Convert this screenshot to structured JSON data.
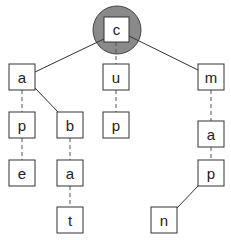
{
  "diagram": {
    "type": "trie",
    "highlight_color": "#8a8a8a",
    "root": {
      "id": "c",
      "label": "c",
      "highlighted": true
    },
    "nodes": [
      {
        "id": "c",
        "label": "c",
        "x": 104,
        "y": 17
      },
      {
        "id": "a1",
        "label": "a",
        "x": 9,
        "y": 64
      },
      {
        "id": "u",
        "label": "u",
        "x": 103,
        "y": 64
      },
      {
        "id": "m",
        "label": "m",
        "x": 198,
        "y": 64
      },
      {
        "id": "p1",
        "label": "p",
        "x": 9,
        "y": 112
      },
      {
        "id": "b",
        "label": "b",
        "x": 57,
        "y": 112
      },
      {
        "id": "p2",
        "label": "p",
        "x": 103,
        "y": 112
      },
      {
        "id": "a3",
        "label": "a",
        "x": 198,
        "y": 121
      },
      {
        "id": "e",
        "label": "e",
        "x": 9,
        "y": 160
      },
      {
        "id": "a2",
        "label": "a",
        "x": 57,
        "y": 160
      },
      {
        "id": "p3",
        "label": "p",
        "x": 198,
        "y": 160
      },
      {
        "id": "t",
        "label": "t",
        "x": 57,
        "y": 207
      },
      {
        "id": "n",
        "label": "n",
        "x": 151,
        "y": 207
      }
    ],
    "edges": [
      {
        "from": "c",
        "to": "a1",
        "style": "solid"
      },
      {
        "from": "c",
        "to": "u",
        "style": "dashed"
      },
      {
        "from": "c",
        "to": "m",
        "style": "solid"
      },
      {
        "from": "a1",
        "to": "p1",
        "style": "dashed"
      },
      {
        "from": "a1",
        "to": "b",
        "style": "solid"
      },
      {
        "from": "u",
        "to": "p2",
        "style": "dashed"
      },
      {
        "from": "m",
        "to": "a3",
        "style": "dashed"
      },
      {
        "from": "p1",
        "to": "e",
        "style": "dashed"
      },
      {
        "from": "b",
        "to": "a2",
        "style": "dashed"
      },
      {
        "from": "a3",
        "to": "p3",
        "style": "dashed"
      },
      {
        "from": "a2",
        "to": "t",
        "style": "dashed"
      },
      {
        "from": "p3",
        "to": "n",
        "style": "solid"
      }
    ],
    "words": [
      "cape",
      "cabat",
      "cup",
      "cmapn"
    ]
  }
}
